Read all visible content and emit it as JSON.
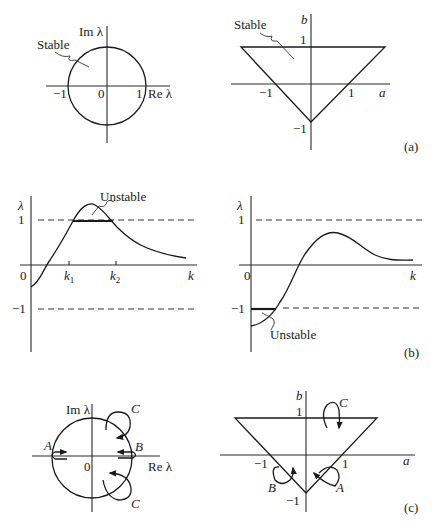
{
  "figure": {
    "panels": {
      "a": {
        "tag": "(a)",
        "left": {
          "title": "Unit circle in complex eigenvalue plane",
          "y_label": "Im λ",
          "x_label": "Re λ",
          "ticks": [
            "−1",
            "0",
            "1"
          ],
          "region_label": "Stable"
        },
        "right": {
          "title": "Stability triangle in (a, b) plane",
          "y_label": "b",
          "x_label": "a",
          "ticks_x": [
            "−1",
            "1"
          ],
          "ticks_y": [
            "1",
            "−1"
          ],
          "region_label": "Stable",
          "vertices": [
            [
              -2,
              1
            ],
            [
              2,
              1
            ],
            [
              0,
              -1
            ]
          ]
        }
      },
      "b": {
        "tag": "(b)",
        "left": {
          "y_label": "λ",
          "x_label": "k",
          "origin": "0",
          "ticks_y": [
            "1",
            "−1"
          ],
          "ticks_x": [
            "k₁",
            "k₂"
          ],
          "k1_sub": "1",
          "k2_sub": "2",
          "k_letter": "k",
          "annotation": "Unstable"
        },
        "right": {
          "y_label": "λ",
          "x_label": "k",
          "origin": "0",
          "ticks_y": [
            "1",
            "−1"
          ],
          "annotation": "Unstable"
        }
      },
      "c": {
        "tag": "(c)",
        "left": {
          "y_label": "Im λ",
          "x_label": "Re λ",
          "origin": "0",
          "paths": [
            "A",
            "B",
            "C",
            "C"
          ]
        },
        "right": {
          "y_label": "b",
          "x_label": "a",
          "ticks_x": [
            "−1",
            "1"
          ],
          "ticks_y": [
            "1",
            "−1"
          ],
          "paths": [
            "C",
            "B",
            "A"
          ]
        }
      }
    }
  }
}
